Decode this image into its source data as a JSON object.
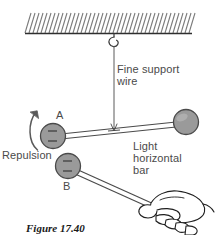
{
  "figure": {
    "caption": "Figure 17.40",
    "labels": {
      "fine_support_wire": "Fine support\nwire",
      "light_horizontal_bar": "Light\nhorizontal\nbar",
      "repulsion": "Repulsion",
      "ball_a": "A",
      "ball_b": "B",
      "charge_sign": "−"
    },
    "colors": {
      "ball_fill": "#9a9a9a",
      "ball_stroke": "#4a4a4a",
      "line": "#3a3a3a",
      "hatch": "#6f6f6f",
      "text": "#4a4a4a",
      "caption_text": "#1a1a1a",
      "background": "#ffffff"
    },
    "elements": {
      "ceiling": "hatched-ceiling",
      "hook": "ceiling-hook",
      "support_wire": "vertical-fine-wire",
      "horizontal_bar": "light-horizontal-bar",
      "pivot": "bar-pivot-point",
      "ball_a": "charged-sphere-a",
      "ball_right": "counterweight-sphere",
      "ball_b": "charged-sphere-b-on-rod",
      "rod": "handheld-rod",
      "hand": "hand-holding-rod",
      "repulsion_arrow": "curved-repulsion-arrow"
    }
  }
}
